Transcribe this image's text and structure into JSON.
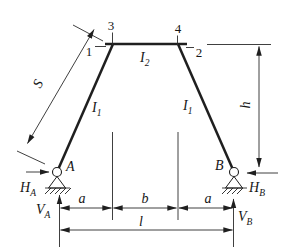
{
  "figure": {
    "colors": {
      "background": "#ffffff",
      "ink": "#1f1f1f"
    },
    "nodes": {
      "n1": "1",
      "n2": "2",
      "n3": "3",
      "n4": "4"
    },
    "joints": {
      "a": "A",
      "b": "B"
    },
    "members": {
      "left_leg": {
        "symbol": "I",
        "subscript": "1"
      },
      "right_leg": {
        "symbol": "I",
        "subscript": "1"
      },
      "top_beam": {
        "symbol": "I",
        "subscript": "2"
      }
    },
    "reactions": {
      "ha": {
        "symbol": "H",
        "subscript": "A"
      },
      "hb": {
        "symbol": "H",
        "subscript": "B"
      },
      "va": {
        "symbol": "V",
        "subscript": "A"
      },
      "vb": {
        "symbol": "V",
        "subscript": "B"
      }
    },
    "dimensions": {
      "s": "S",
      "h": "h",
      "a_left": "a",
      "b": "b",
      "a_right": "a",
      "span": "l"
    }
  }
}
